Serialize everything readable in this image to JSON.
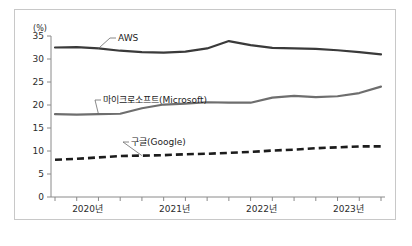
{
  "chart_data": {
    "type": "line",
    "title": "",
    "xlabel": "",
    "ylabel": "(%)",
    "unit_label": "(%)",
    "ylim": [
      0,
      35
    ],
    "yticks": [
      0,
      5,
      10,
      15,
      20,
      25,
      30,
      35
    ],
    "ytick_labels": [
      "0",
      "5",
      "10",
      "15",
      "20",
      "25",
      "30",
      "35"
    ],
    "grid": false,
    "legend_position": "inline-annotations",
    "x": [
      "2020 Q1",
      "2020 Q2",
      "2020 Q3",
      "2020 Q4",
      "2021 Q1",
      "2021 Q2",
      "2021 Q3",
      "2021 Q4",
      "2022 Q1",
      "2022 Q2",
      "2022 Q3",
      "2022 Q4",
      "2023 Q1",
      "2023 Q2",
      "2023 Q3",
      "2023 Q4"
    ],
    "xtick_labels": [
      "2020년",
      "2021년",
      "2022년",
      "2023년"
    ],
    "xtick_label_positions": [
      1.5,
      5.5,
      9.5,
      13.5
    ],
    "series": [
      {
        "name": "AWS",
        "label": "AWS",
        "color": "#3a3a3a",
        "style": "solid",
        "values": [
          32.5,
          32.6,
          32.3,
          31.8,
          31.5,
          31.4,
          31.6,
          32.3,
          33.9,
          33.0,
          32.4,
          32.3,
          32.2,
          31.9,
          31.5,
          31.0
        ]
      },
      {
        "name": "마이크로소프트(Microsoft)",
        "label": "마이크로소프트(Microsoft)",
        "color": "#6e6e6e",
        "style": "solid",
        "values": [
          18.0,
          17.9,
          18.0,
          18.1,
          19.3,
          20.1,
          20.3,
          20.6,
          20.5,
          20.5,
          21.6,
          22.0,
          21.7,
          21.9,
          22.6,
          24.0
        ]
      },
      {
        "name": "구글(Google)",
        "label": "구글(Google)",
        "color": "#1c1c1c",
        "style": "dashed",
        "values": [
          8.1,
          8.3,
          8.6,
          8.9,
          9.0,
          9.1,
          9.3,
          9.4,
          9.6,
          9.8,
          10.1,
          10.3,
          10.6,
          10.8,
          11.0,
          11.0
        ]
      }
    ],
    "annotations": [
      {
        "text": "AWS",
        "series": "AWS"
      },
      {
        "text": "마이크로소프트(Microsoft)",
        "series": "마이크로소프트(Microsoft)"
      },
      {
        "text": "구글(Google)",
        "series": "구글(Google)"
      }
    ]
  },
  "axis": {
    "unit": "(%)",
    "y_labels": [
      "35",
      "30",
      "25",
      "20",
      "15",
      "10",
      "5",
      "0"
    ],
    "x_labels": [
      "2020년",
      "2021년",
      "2022년",
      "2023년"
    ]
  },
  "labels": {
    "aws": "AWS",
    "microsoft": "마이크로소프트(Microsoft)",
    "google": "구글(Google)"
  },
  "colors": {
    "aws": "#3a3a3a",
    "microsoft": "#6e6e6e",
    "google": "#1c1c1c",
    "axis": "#8a8a8a",
    "border": "#c8c8c8"
  }
}
